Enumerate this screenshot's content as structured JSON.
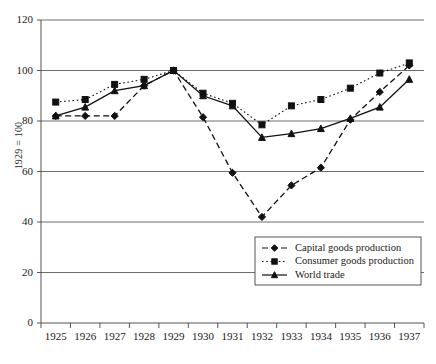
{
  "chart_data": {
    "type": "line",
    "title": "",
    "xlabel": "",
    "ylabel": "1929 = 100",
    "x": [
      1925,
      1926,
      1927,
      1928,
      1929,
      1930,
      1931,
      1932,
      1933,
      1934,
      1935,
      1936,
      1937
    ],
    "xtick_labels": [
      "1925",
      "1926",
      "1927",
      "1928",
      "1929",
      "1930",
      "1931",
      "1932",
      "1933",
      "1934",
      "1935",
      "1936",
      "1937"
    ],
    "ytick_labels": [
      "0",
      "20",
      "40",
      "60",
      "80",
      "100",
      "120"
    ],
    "yticks": [
      0,
      20,
      40,
      60,
      80,
      100,
      120
    ],
    "ylim": [
      0,
      120
    ],
    "grid": "horizontal",
    "legend_position": "lower-right-inside",
    "series": [
      {
        "name": "Capital goods production",
        "marker": "diamond",
        "linestyle": "dashed",
        "color": "#111111",
        "values": [
          82,
          82,
          82,
          94,
          100,
          81.5,
          59.5,
          42,
          54.5,
          61.5,
          80.5,
          91.5,
          102
        ]
      },
      {
        "name": "Consumer goods production",
        "marker": "square",
        "linestyle": "dotted",
        "color": "#111111",
        "values": [
          87.5,
          88.5,
          94.5,
          96.5,
          100,
          91,
          87,
          78.5,
          86,
          88.5,
          93,
          99,
          103
        ]
      },
      {
        "name": "World trade",
        "marker": "triangle",
        "linestyle": "solid",
        "color": "#111111",
        "values": [
          82,
          85.5,
          92,
          94,
          100,
          90,
          86,
          73.5,
          75,
          77,
          81,
          85.5,
          96.5
        ]
      }
    ]
  },
  "legend": {
    "entries": [
      {
        "label": "Capital goods production"
      },
      {
        "label": "Consumer goods production"
      },
      {
        "label": "World trade"
      }
    ]
  },
  "axis": {
    "y_title": "1929 = 100"
  }
}
